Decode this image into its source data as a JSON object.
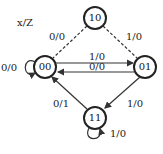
{
  "legend": "x/Z",
  "states": [
    {
      "id": "10",
      "label": "10"
    },
    {
      "id": "00",
      "label": "00"
    },
    {
      "id": "01",
      "label": "01"
    },
    {
      "id": "11",
      "label": "11"
    }
  ],
  "transitions": [
    {
      "from": "00",
      "to": "00",
      "label": "0/0",
      "style": "solid"
    },
    {
      "from": "10",
      "to": "00",
      "label": "0/0",
      "style": "dashed"
    },
    {
      "from": "10",
      "to": "01",
      "label": "1/0",
      "style": "dashed"
    },
    {
      "from": "00",
      "to": "01",
      "label": "1/0",
      "style": "solid"
    },
    {
      "from": "01",
      "to": "00",
      "label": "0/0",
      "style": "solid"
    },
    {
      "from": "11",
      "to": "00",
      "label": "0/1",
      "style": "solid"
    },
    {
      "from": "01",
      "to": "11",
      "label": "1/0",
      "style": "solid"
    },
    {
      "from": "11",
      "to": "11",
      "label": "1/0",
      "style": "solid"
    }
  ]
}
